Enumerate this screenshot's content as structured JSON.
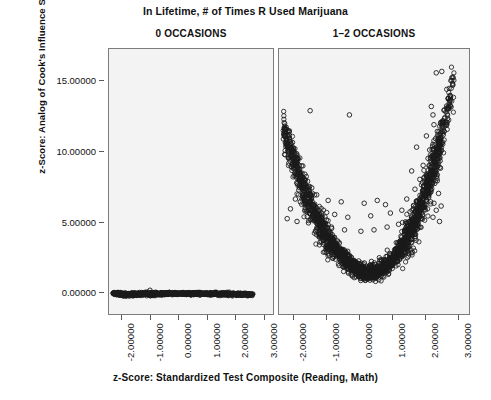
{
  "chart_data": {
    "type": "scatter",
    "title": "In Lifetime, # of Times R Used Marijuana",
    "xlabel": "z-Score: Standardized Test Composite (Reading, Math)",
    "ylabel": "z-Score: Analog of Cook's Influence Statistics",
    "grid": false,
    "legend": "none",
    "marker": "open-circle",
    "marker_color": "#1a1a1a",
    "panel_background": "#f3f3f3",
    "xlim": [
      -2.45,
      3.35
    ],
    "ylim": [
      -1.6,
      17.3
    ],
    "xticks": [
      -2.0,
      -1.0,
      0.0,
      1.0,
      2.0,
      3.0
    ],
    "yticks": [
      0.0,
      5.0,
      10.0,
      15.0
    ],
    "xtick_labels": [
      "-2.00000",
      "-1.00000",
      "0.00000",
      "1.00000",
      "2.00000",
      "3.00000"
    ],
    "ytick_labels": [
      "0.00000",
      "5.00000",
      "10.00000",
      "15.00000"
    ],
    "panels": [
      {
        "label": "0 OCCASIONS",
        "n_points": 520,
        "description": "Dense near-flat band of overlapping points just below y=0, spanning x from -2.3 to 2.6, with a very slight downward slope toward the left.",
        "points": [
          [
            -2.3,
            -0.12
          ],
          [
            -2.26,
            -0.14
          ],
          [
            -2.22,
            -0.1
          ],
          [
            -2.18,
            -0.18
          ],
          [
            -2.14,
            -0.08
          ],
          [
            -2.1,
            -0.2
          ],
          [
            -2.06,
            -0.12
          ],
          [
            -2.02,
            -0.22
          ],
          [
            -1.98,
            -0.15
          ],
          [
            -1.94,
            -0.25
          ],
          [
            -1.9,
            -0.13
          ],
          [
            -1.86,
            -0.24
          ],
          [
            -1.82,
            -0.17
          ],
          [
            -1.78,
            -0.26
          ],
          [
            -1.74,
            -0.14
          ],
          [
            -1.7,
            -0.23
          ],
          [
            -1.66,
            -0.16
          ],
          [
            -1.62,
            -0.27
          ],
          [
            -1.58,
            -0.13
          ],
          [
            -1.54,
            -0.22
          ],
          [
            -1.5,
            -0.18
          ],
          [
            -1.46,
            -0.25
          ],
          [
            -1.42,
            -0.12
          ],
          [
            -1.38,
            -0.21
          ],
          [
            -1.34,
            -0.16
          ],
          [
            -1.3,
            -0.24
          ],
          [
            -1.26,
            -0.11
          ],
          [
            -1.22,
            -0.2
          ],
          [
            -1.18,
            -0.15
          ],
          [
            -1.14,
            -0.23
          ],
          [
            -1.1,
            -0.1
          ],
          [
            -1.06,
            -0.19
          ],
          [
            -1.02,
            -0.14
          ],
          [
            -0.98,
            -0.22
          ],
          [
            -0.94,
            -0.12
          ],
          [
            -0.9,
            -0.18
          ],
          [
            -0.86,
            -0.13
          ],
          [
            -0.82,
            -0.21
          ],
          [
            -0.78,
            -0.11
          ],
          [
            -0.74,
            -0.17
          ],
          [
            -0.7,
            -0.14
          ],
          [
            -0.66,
            -0.2
          ],
          [
            -0.62,
            -0.1
          ],
          [
            -0.58,
            -0.16
          ],
          [
            -0.54,
            -0.13
          ],
          [
            -0.5,
            -0.19
          ],
          [
            -0.46,
            -0.11
          ],
          [
            -0.42,
            -0.17
          ],
          [
            -0.38,
            -0.12
          ],
          [
            -0.34,
            -0.18
          ],
          [
            -0.3,
            -0.1
          ],
          [
            -0.26,
            -0.16
          ],
          [
            -0.22,
            -0.12
          ],
          [
            -0.18,
            -0.17
          ],
          [
            -0.14,
            -0.11
          ],
          [
            -0.1,
            -0.15
          ],
          [
            -0.06,
            -0.12
          ],
          [
            -0.02,
            -0.16
          ],
          [
            0.02,
            -0.1
          ],
          [
            0.06,
            -0.15
          ],
          [
            0.1,
            -0.12
          ],
          [
            0.14,
            -0.16
          ],
          [
            0.18,
            -0.11
          ],
          [
            0.22,
            -0.15
          ],
          [
            0.26,
            -0.12
          ],
          [
            0.3,
            -0.17
          ],
          [
            0.34,
            -0.1
          ],
          [
            0.38,
            -0.15
          ],
          [
            0.42,
            -0.12
          ],
          [
            0.46,
            -0.17
          ],
          [
            0.5,
            -0.11
          ],
          [
            0.54,
            -0.16
          ],
          [
            0.58,
            -0.12
          ],
          [
            0.62,
            -0.17
          ],
          [
            0.66,
            -0.11
          ],
          [
            0.7,
            -0.16
          ],
          [
            0.74,
            -0.12
          ],
          [
            0.78,
            -0.18
          ],
          [
            0.82,
            -0.11
          ],
          [
            0.86,
            -0.16
          ],
          [
            0.9,
            -0.13
          ],
          [
            0.94,
            -0.18
          ],
          [
            0.98,
            -0.12
          ],
          [
            1.02,
            -0.17
          ],
          [
            1.06,
            -0.13
          ],
          [
            1.1,
            -0.19
          ],
          [
            1.14,
            -0.12
          ],
          [
            1.18,
            -0.18
          ],
          [
            1.22,
            -0.13
          ],
          [
            1.26,
            -0.19
          ],
          [
            1.3,
            -0.12
          ],
          [
            1.34,
            -0.18
          ],
          [
            1.38,
            -0.14
          ],
          [
            1.42,
            -0.2
          ],
          [
            1.46,
            -0.13
          ],
          [
            1.5,
            -0.19
          ],
          [
            1.54,
            -0.14
          ],
          [
            1.58,
            -0.2
          ],
          [
            1.62,
            -0.13
          ],
          [
            1.66,
            -0.19
          ],
          [
            1.7,
            -0.15
          ],
          [
            1.74,
            -0.21
          ],
          [
            1.78,
            -0.14
          ],
          [
            1.82,
            -0.2
          ],
          [
            1.86,
            -0.15
          ],
          [
            1.9,
            -0.21
          ],
          [
            1.94,
            -0.14
          ],
          [
            1.98,
            -0.2
          ],
          [
            2.02,
            -0.16
          ],
          [
            2.06,
            -0.22
          ],
          [
            2.1,
            -0.15
          ],
          [
            2.14,
            -0.21
          ],
          [
            2.18,
            -0.16
          ],
          [
            2.22,
            -0.22
          ],
          [
            2.26,
            -0.15
          ],
          [
            2.3,
            -0.21
          ],
          [
            2.34,
            -0.17
          ],
          [
            2.38,
            -0.23
          ],
          [
            2.42,
            -0.16
          ],
          [
            2.46,
            -0.22
          ],
          [
            2.5,
            -0.18
          ],
          [
            2.54,
            -0.24
          ],
          [
            2.58,
            -0.17
          ],
          [
            2.6,
            -0.23
          ]
        ],
        "outlier_points": [
          [
            -1.0,
            0.1
          ]
        ]
      },
      {
        "label": "1–2 OCCASIONS",
        "n_points": 900,
        "description": "U-shaped (parabolic) cloud of open circles. Dense dark core following a quadratic minimum near x=0.3 at y≈1.2, rising to y≈6 at x=-2.2 and to y≈16 at x=2.5. Sparse scattered outliers above the main band, heaviest on the right side.",
        "core_curve": {
          "vertex_x": 0.35,
          "vertex_y": 1.1,
          "a_left": 1.45,
          "a_right": 2.1,
          "band_thickness": 1.1
        },
        "outliers": [
          [
            -1.5,
            12.9
          ],
          [
            -0.3,
            12.6
          ],
          [
            2.35,
            15.6
          ],
          [
            2.52,
            15.7
          ],
          [
            2.2,
            13.2
          ],
          [
            2.25,
            12.6
          ],
          [
            2.28,
            11.9
          ],
          [
            2.05,
            11.1
          ],
          [
            2.33,
            10.9
          ],
          [
            2.45,
            10.6
          ],
          [
            1.75,
            10.3
          ],
          [
            2.15,
            10.1
          ],
          [
            2.4,
            9.9
          ],
          [
            2.1,
            9.5
          ],
          [
            2.3,
            9.2
          ],
          [
            1.95,
            9.0
          ],
          [
            2.48,
            8.8
          ],
          [
            1.6,
            8.6
          ],
          [
            2.22,
            8.5
          ],
          [
            2.05,
            8.2
          ],
          [
            1.85,
            8.0
          ],
          [
            2.38,
            7.9
          ],
          [
            -1.7,
            7.6
          ],
          [
            -1.45,
            7.4
          ],
          [
            2.18,
            7.5
          ],
          [
            1.7,
            7.3
          ],
          [
            1.98,
            7.1
          ],
          [
            2.42,
            7.0
          ],
          [
            -1.95,
            6.6
          ],
          [
            -1.8,
            6.4
          ],
          [
            -1.3,
            6.9
          ],
          [
            -0.95,
            6.5
          ],
          [
            -0.55,
            6.4
          ],
          [
            0.15,
            6.3
          ],
          [
            0.55,
            6.5
          ],
          [
            0.8,
            6.2
          ],
          [
            1.45,
            6.6
          ],
          [
            1.88,
            6.5
          ],
          [
            2.28,
            6.3
          ],
          [
            2.5,
            6.1
          ],
          [
            -2.1,
            5.9
          ],
          [
            -1.6,
            5.7
          ],
          [
            -1.15,
            5.6
          ],
          [
            -0.75,
            5.5
          ],
          [
            -0.35,
            5.3
          ],
          [
            0.35,
            5.4
          ],
          [
            0.95,
            5.6
          ],
          [
            1.3,
            5.8
          ],
          [
            1.65,
            5.9
          ],
          [
            2.0,
            6.0
          ],
          [
            2.35,
            5.8
          ],
          [
            -2.2,
            5.2
          ],
          [
            -1.9,
            5.0
          ],
          [
            -1.55,
            4.9
          ],
          [
            -1.2,
            4.7
          ],
          [
            -0.85,
            4.6
          ],
          [
            -0.45,
            4.4
          ],
          [
            0.05,
            4.3
          ],
          [
            0.45,
            4.4
          ],
          [
            0.85,
            4.6
          ],
          [
            1.2,
            4.8
          ],
          [
            1.55,
            5.0
          ],
          [
            1.9,
            5.2
          ],
          [
            2.25,
            5.3
          ],
          [
            2.45,
            5.0
          ]
        ]
      }
    ]
  },
  "figure": {
    "main_title": "In Lifetime, # of Times R Used Marijuana",
    "x_axis_title": "z-Score: Standardized Test Composite (Reading, Math)",
    "y_axis_title": "z-Score: Analog of Cook's Influence Statistics"
  }
}
